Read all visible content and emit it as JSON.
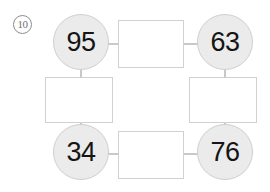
{
  "worksheet": {
    "problem_number": "10",
    "problem_marker_name": "circled-number-ten",
    "background_color": "#ffffff",
    "circle_fill_color": "#ebebeb",
    "circle_border_color": "#cfcfcf",
    "box_border_color": "#d0d0d0",
    "connector_color": "#c9c9c9",
    "number_text_color": "#151515"
  },
  "nodes": {
    "top_left": {
      "label": "95",
      "name": "node-circle-top-left"
    },
    "top_right": {
      "label": "63",
      "name": "node-circle-top-right"
    },
    "bottom_left": {
      "label": "34",
      "name": "node-circle-bottom-left"
    },
    "bottom_right": {
      "label": "76",
      "name": "node-circle-bottom-right"
    }
  },
  "boxes": {
    "top": {
      "value": "",
      "name": "answer-box-top"
    },
    "left": {
      "value": "",
      "name": "answer-box-left"
    },
    "right": {
      "value": "",
      "name": "answer-box-right"
    },
    "bottom": {
      "value": "",
      "name": "answer-box-bottom"
    }
  },
  "chart_data": {
    "type": "diagram",
    "title": "",
    "nodes": [
      {
        "id": "tl",
        "label": "95",
        "shape": "circle",
        "position": "top-left"
      },
      {
        "id": "tr",
        "label": "63",
        "shape": "circle",
        "position": "top-right"
      },
      {
        "id": "bl",
        "label": "34",
        "shape": "circle",
        "position": "bottom-left"
      },
      {
        "id": "br",
        "label": "76",
        "shape": "circle",
        "position": "bottom-right"
      },
      {
        "id": "box-top",
        "label": "",
        "shape": "rectangle",
        "position": "top-center"
      },
      {
        "id": "box-left",
        "label": "",
        "shape": "rectangle",
        "position": "middle-left"
      },
      {
        "id": "box-right",
        "label": "",
        "shape": "rectangle",
        "position": "middle-right"
      },
      {
        "id": "box-bottom",
        "label": "",
        "shape": "rectangle",
        "position": "bottom-center"
      }
    ],
    "edges": [
      {
        "from": "tl",
        "to": "box-top"
      },
      {
        "from": "box-top",
        "to": "tr"
      },
      {
        "from": "tl",
        "to": "box-left"
      },
      {
        "from": "box-left",
        "to": "bl"
      },
      {
        "from": "tr",
        "to": "box-right"
      },
      {
        "from": "box-right",
        "to": "br"
      },
      {
        "from": "bl",
        "to": "box-bottom"
      },
      {
        "from": "box-bottom",
        "to": "br"
      }
    ]
  }
}
